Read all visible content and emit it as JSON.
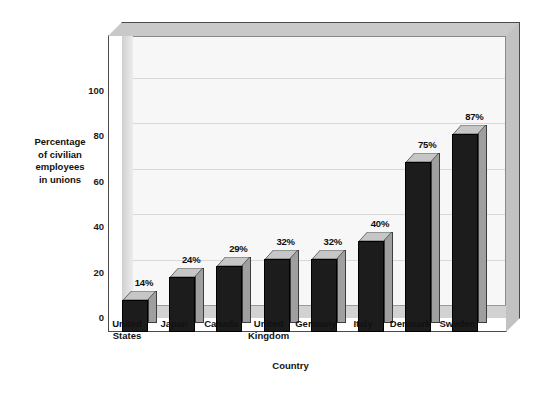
{
  "chart_data": {
    "type": "bar",
    "title": "",
    "subtitle": "",
    "xlabel": "Country",
    "ylabel": "Percentage of civilian employees in unions",
    "ylabel_lines": [
      "Percentage",
      "of civilian",
      "employees",
      "in unions"
    ],
    "categories": [
      "United States",
      "Japan",
      "Canada",
      "United Kingdom",
      "Germany",
      "Italy",
      "Denmark",
      "Sweden"
    ],
    "category_lines": [
      [
        "United",
        "States"
      ],
      [
        "Japan"
      ],
      [
        "Canada"
      ],
      [
        "United",
        "Kingdom"
      ],
      [
        "Germany"
      ],
      [
        "Italy"
      ],
      [
        "Denmark"
      ],
      [
        "Sweden"
      ]
    ],
    "values": [
      14,
      24,
      29,
      32,
      32,
      40,
      75,
      87
    ],
    "data_labels": [
      "14%",
      "24%",
      "29%",
      "32%",
      "32%",
      "40%",
      "75%",
      "87%"
    ],
    "ylim": [
      0,
      110
    ],
    "yticks": [
      0,
      20,
      40,
      60,
      80,
      100
    ],
    "ytick_labels": [
      "0",
      "20",
      "40",
      "60",
      "80",
      "100"
    ],
    "grid": true,
    "grid_axis": "y",
    "legend": "none",
    "style": "3d-column",
    "colors": {
      "bar_front": "#1c1c1c",
      "bar_side": "#9f9f9f",
      "bar_top": "#c6c6c6",
      "plot_background": "#f7f7f7",
      "frame": "#c9c9c9",
      "gridline": "#d8d8d8",
      "floor": "#d2d2d2",
      "text": "#111111"
    }
  }
}
